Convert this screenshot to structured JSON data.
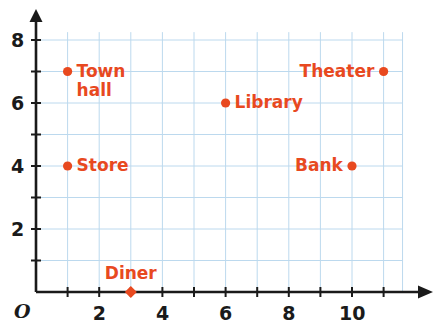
{
  "chart_data": {
    "type": "scatter",
    "title": "",
    "xlabel": "",
    "ylabel": "",
    "origin_label": "O",
    "xlim": [
      0,
      11.6
    ],
    "ylim": [
      0,
      8.25
    ],
    "grid": true,
    "grid_color": "#bcd9ee",
    "axis_color": "#1a1a1a",
    "point_color": "#e8491f",
    "label_color": "#e8491f",
    "tick_step": 1,
    "x_tick_labels": [
      {
        "value": 2,
        "text": "2"
      },
      {
        "value": 4,
        "text": "4"
      },
      {
        "value": 6,
        "text": "6"
      },
      {
        "value": 8,
        "text": "8"
      },
      {
        "value": 10,
        "text": "10"
      }
    ],
    "y_tick_labels": [
      {
        "value": 2,
        "text": "2"
      },
      {
        "value": 4,
        "text": "4"
      },
      {
        "value": 6,
        "text": "6"
      },
      {
        "value": 8,
        "text": "8"
      }
    ],
    "points": [
      {
        "name": "Town hall",
        "label": "Town\nhall",
        "x": 1,
        "y": 7,
        "marker": "circle",
        "label_side": "right"
      },
      {
        "name": "Store",
        "label": "Store",
        "x": 1,
        "y": 4,
        "marker": "circle",
        "label_side": "right"
      },
      {
        "name": "Library",
        "label": "Library",
        "x": 6,
        "y": 6,
        "marker": "circle",
        "label_side": "right"
      },
      {
        "name": "Theater",
        "label": "Theater",
        "x": 11,
        "y": 7,
        "marker": "circle",
        "label_side": "left"
      },
      {
        "name": "Bank",
        "label": "Bank",
        "x": 10,
        "y": 4,
        "marker": "circle",
        "label_side": "left"
      },
      {
        "name": "Diner",
        "label": "Diner",
        "x": 3,
        "y": 0,
        "marker": "diamond",
        "label_side": "above"
      }
    ]
  }
}
